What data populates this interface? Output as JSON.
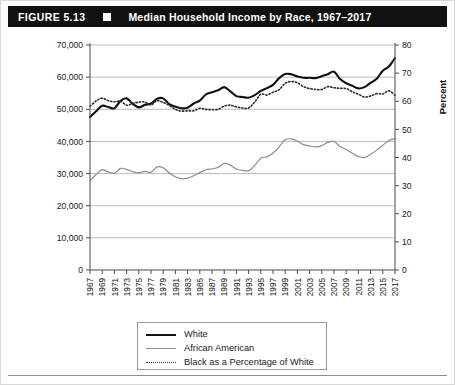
{
  "figure": {
    "number": "FIGURE 5.13",
    "marker": "square-marker",
    "title": "Median Household Income by Race, 1967–2017"
  },
  "axes": {
    "left_title": "Median Household Income in 2017 Dollars",
    "right_title": "Percent"
  },
  "legend": {
    "items": [
      {
        "label": "White",
        "style": "solid-thick-black",
        "color": "#111111"
      },
      {
        "label": "African American",
        "style": "solid-thin-gray",
        "color": "#8c8c8c"
      },
      {
        "label": "Black as a Percentage of White",
        "style": "dotted-black",
        "color": "#333333"
      }
    ]
  },
  "chart_data": {
    "type": "line",
    "title": "Median Household Income by Race, 1967–2017",
    "xlabel": "",
    "ylabel": "Median Household Income in 2017 Dollars",
    "y2label": "Percent",
    "ylim": [
      0,
      70000
    ],
    "y2lim": [
      0,
      80
    ],
    "yticks": [
      0,
      10000,
      20000,
      30000,
      40000,
      50000,
      60000,
      70000
    ],
    "ytick_labels": [
      "0",
      "10,000",
      "20,000",
      "30,000",
      "40,000",
      "50,000",
      "60,000",
      "70,000"
    ],
    "y2ticks": [
      0,
      10,
      20,
      30,
      40,
      50,
      60,
      70,
      80
    ],
    "y2tick_labels": [
      "0",
      "10",
      "20",
      "30",
      "40",
      "50",
      "60",
      "70",
      "80"
    ],
    "grid": true,
    "legend_position": "below",
    "xlim": [
      1967,
      2017
    ],
    "x": [
      1967,
      1968,
      1969,
      1970,
      1971,
      1972,
      1973,
      1974,
      1975,
      1976,
      1977,
      1978,
      1979,
      1980,
      1981,
      1982,
      1983,
      1984,
      1985,
      1986,
      1987,
      1988,
      1989,
      1990,
      1991,
      1992,
      1993,
      1994,
      1995,
      1996,
      1997,
      1998,
      1999,
      2000,
      2001,
      2002,
      2003,
      2004,
      2005,
      2006,
      2007,
      2008,
      2009,
      2010,
      2011,
      2012,
      2013,
      2014,
      2015,
      2016,
      2017
    ],
    "xtick_labels": [
      "1967",
      "1969",
      "1971",
      "1973",
      "1975",
      "1977",
      "1979",
      "1981",
      "1983",
      "1985",
      "1987",
      "1989",
      "1991",
      "1993",
      "1995",
      "1997",
      "1999",
      "2001",
      "2003",
      "2005",
      "2007",
      "2009",
      "2011",
      "2013",
      "2015",
      "2017"
    ],
    "series": [
      {
        "name": "White",
        "axis": "left",
        "units": "2017 dollars",
        "values": [
          47600,
          49400,
          51100,
          50700,
          50300,
          52600,
          53400,
          51700,
          50600,
          51400,
          51800,
          53300,
          53400,
          51600,
          50800,
          50300,
          50500,
          51800,
          52700,
          54600,
          55300,
          55900,
          56900,
          55600,
          54100,
          53800,
          53600,
          54400,
          55700,
          56600,
          57600,
          59700,
          61000,
          60900,
          60200,
          59800,
          59800,
          59700,
          60300,
          60900,
          61700,
          59400,
          58100,
          57300,
          56500,
          56900,
          58200,
          59500,
          62000,
          63300,
          65900
        ]
      },
      {
        "name": "African American",
        "axis": "left",
        "units": "2017 dollars",
        "values": [
          27700,
          29700,
          31200,
          30500,
          30100,
          31600,
          31300,
          30600,
          30200,
          30700,
          30400,
          32100,
          31800,
          30200,
          29000,
          28400,
          28600,
          29300,
          30300,
          31200,
          31500,
          31900,
          33200,
          32600,
          31400,
          31000,
          30900,
          32500,
          34800,
          35200,
          36400,
          38300,
          40500,
          40800,
          40100,
          39000,
          38600,
          38300,
          38700,
          39700,
          40000,
          38400,
          37500,
          36300,
          35300,
          35000,
          36000,
          37300,
          38800,
          40300,
          40900
        ]
      },
      {
        "name": "Black as a Percentage of White",
        "axis": "right",
        "units": "percent",
        "values": [
          58.2,
          60.1,
          61.1,
          60.2,
          59.8,
          60.1,
          58.6,
          59.2,
          59.7,
          59.7,
          58.7,
          60.2,
          59.6,
          58.5,
          57.1,
          56.5,
          56.6,
          56.6,
          57.5,
          57.1,
          57.0,
          57.1,
          58.3,
          58.6,
          58.0,
          57.6,
          57.6,
          59.7,
          62.5,
          62.2,
          63.2,
          64.1,
          66.4,
          67.0,
          66.6,
          65.2,
          64.5,
          64.2,
          64.2,
          65.2,
          64.8,
          64.6,
          64.5,
          63.4,
          62.5,
          61.5,
          61.9,
          62.7,
          62.6,
          63.7,
          62.1
        ]
      }
    ]
  }
}
